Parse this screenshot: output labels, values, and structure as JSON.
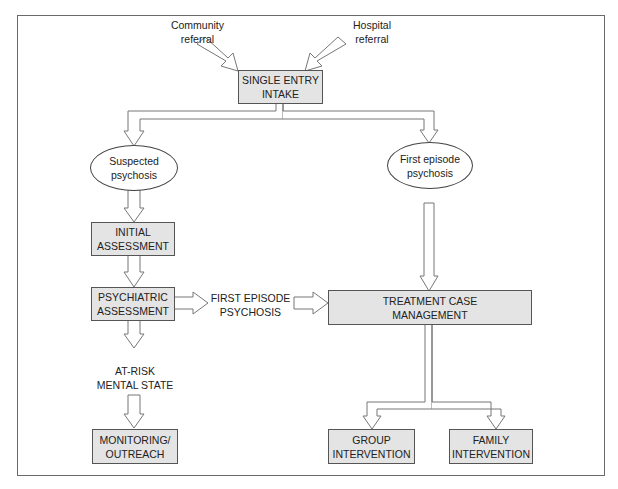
{
  "diagram": {
    "referrals": {
      "community": [
        "Community",
        "referral"
      ],
      "hospital": [
        "Hospital",
        "referral"
      ]
    },
    "single_entry": [
      "SINGLE ENTRY",
      "INTAKE"
    ],
    "suspected": [
      "Suspected",
      "psychosis"
    ],
    "first_episode_node": [
      "First episode",
      "psychosis"
    ],
    "initial_assessment": [
      "INITIAL",
      "ASSESSMENT"
    ],
    "psychiatric_assessment": [
      "PSYCHIATRIC",
      "ASSESSMENT"
    ],
    "first_episode_label": [
      "FIRST EPISODE",
      "PSYCHOSIS"
    ],
    "treatment": [
      "TREATMENT CASE",
      "MANAGEMENT"
    ],
    "at_risk": [
      "AT-RISK",
      "MENTAL STATE"
    ],
    "monitoring": [
      "MONITORING/",
      "OUTREACH"
    ],
    "group": [
      "GROUP",
      "INTERVENTION"
    ],
    "family": [
      "FAMILY",
      "INTERVENTION"
    ]
  },
  "colors": {
    "box_fill": "#e4e4e4",
    "border": "#555555",
    "arrow_stroke": "#777777"
  }
}
